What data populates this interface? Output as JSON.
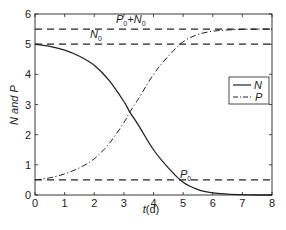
{
  "chart_data": {
    "type": "line",
    "title": "",
    "xlabel": "t(d)",
    "ylabel": "N and P",
    "xlim": [
      0,
      8
    ],
    "ylim": [
      0,
      6
    ],
    "xticks": [
      0,
      1,
      2,
      3,
      4,
      5,
      6,
      7,
      8
    ],
    "yticks": [
      0,
      1,
      2,
      3,
      4,
      5,
      6
    ],
    "grid": false,
    "legend_position": "right-middle",
    "x": [
      0,
      0.5,
      1,
      1.5,
      2,
      2.5,
      3,
      3.2,
      3.5,
      4,
      4.5,
      5,
      5.5,
      6,
      6.5,
      7,
      7.5,
      8
    ],
    "series": [
      {
        "name": "N",
        "style": "solid",
        "values": [
          5.0,
          4.93,
          4.8,
          4.6,
          4.3,
          3.8,
          3.1,
          2.75,
          2.3,
          1.5,
          0.9,
          0.42,
          0.18,
          0.07,
          0.03,
          0.01,
          0.0,
          0.0
        ]
      },
      {
        "name": "P",
        "style": "dash-dot",
        "values": [
          0.5,
          0.57,
          0.7,
          0.9,
          1.2,
          1.7,
          2.4,
          2.75,
          3.2,
          4.0,
          4.6,
          5.08,
          5.32,
          5.43,
          5.47,
          5.49,
          5.5,
          5.5
        ]
      }
    ],
    "reference_lines": [
      {
        "label": "P0+N0",
        "y": 5.5,
        "style": "dashed"
      },
      {
        "label": "N0",
        "y": 5.0,
        "style": "dashed"
      },
      {
        "label": "P0",
        "y": 0.5,
        "style": "dashed"
      }
    ]
  },
  "labels": {
    "xlabel_t": "t",
    "xlabel_unit": "(d)",
    "ylabel": "N and P",
    "ref_p0n0_a": "P",
    "ref_p0n0_sub1": "0",
    "ref_p0n0_plus": "+N",
    "ref_p0n0_sub2": "0",
    "ref_n0": "N",
    "ref_n0_sub": "0",
    "ref_p0": "P",
    "ref_p0_sub": "0",
    "legend_n": "N",
    "legend_p": "P"
  }
}
